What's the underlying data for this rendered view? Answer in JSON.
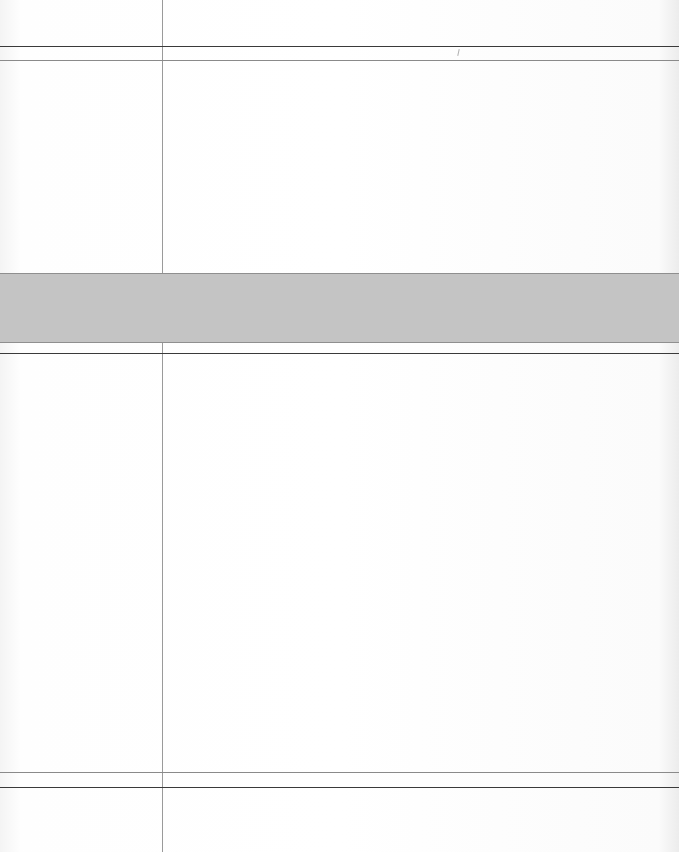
{
  "document": {
    "type": "blank ruled form",
    "sections": [
      {
        "id": "header-row",
        "label": "",
        "value": ""
      },
      {
        "id": "upper-body",
        "label": "",
        "value": ""
      },
      {
        "id": "shaded-band",
        "label": "",
        "value": ""
      },
      {
        "id": "lower-body",
        "label": "",
        "value": ""
      },
      {
        "id": "footer-row",
        "label": "",
        "value": ""
      }
    ]
  },
  "colors": {
    "rule_dark": "#3a3a3a",
    "rule_light": "#8a8a8a",
    "band_fill": "#c4c4c4",
    "paper": "#ffffff"
  }
}
